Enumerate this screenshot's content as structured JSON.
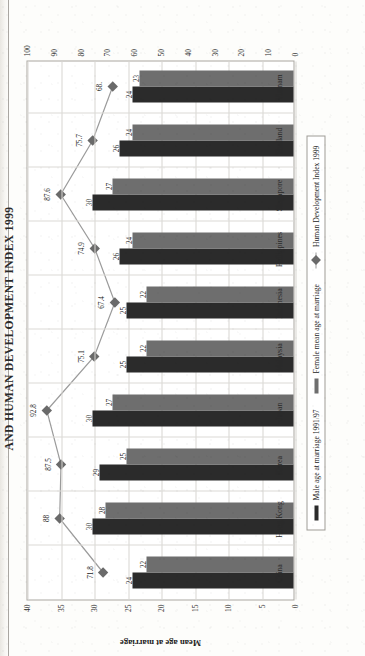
{
  "page": {
    "title": "AND HUMAN DEVELOPMENT INDEX 1999"
  },
  "axes": {
    "left_title": "Mean age at marriage",
    "left_ticks": [
      "40",
      "35",
      "30",
      "25",
      "20",
      "15",
      "10",
      "5",
      "0"
    ],
    "right_ticks": [
      "100",
      "90",
      "80",
      "70",
      "60",
      "50",
      "40",
      "30",
      "20",
      "10",
      "0"
    ]
  },
  "legend": {
    "items": [
      {
        "label": "Male age at marriage 1991/97",
        "marker": "bar-swatch-dark",
        "color": "#2b2b2b"
      },
      {
        "label": "Female mean age at marriage",
        "marker": "bar-swatch-grey",
        "color": "#6e6e6e"
      },
      {
        "label": "Human Development Index 1999",
        "marker": "diamond-line-marker",
        "color": "#6a6a6a"
      }
    ]
  },
  "chart_data": {
    "type": "bar",
    "title": "AND HUMAN DEVELOPMENT INDEX 1999",
    "xlabel": "",
    "ylabel": "Mean age at marriage",
    "ylim": [
      0,
      40
    ],
    "y2lim": [
      0,
      100
    ],
    "grid": true,
    "legend_position": "bottom",
    "categories": [
      "China",
      "Hong Kong",
      "Korea",
      "Japan",
      "Malaysia",
      "Indonesia",
      "Philippines",
      "Singapore",
      "Thailand",
      "Vietnam"
    ],
    "series": [
      {
        "name": "Male age at marriage 1991/97",
        "axis": "left",
        "type": "bar",
        "values": [
          24,
          30,
          29,
          30,
          25,
          25,
          26,
          30,
          26,
          24
        ]
      },
      {
        "name": "Female mean age at marriage",
        "axis": "left",
        "type": "bar",
        "values": [
          22,
          28,
          25,
          27,
          22,
          22,
          24,
          27,
          24,
          23
        ]
      },
      {
        "name": "Human Development Index 1999",
        "axis": "right",
        "type": "line",
        "values": [
          71.8,
          88.0,
          87.5,
          92.8,
          75.1,
          67.4,
          74.9,
          87.6,
          75.7,
          68.2
        ],
        "labels": [
          "71.8",
          "88",
          "87.5",
          "92.8",
          "75.1",
          "67.4",
          "74.9",
          "87.6",
          "75.7",
          "68."
        ]
      }
    ]
  },
  "colors": {
    "male_bar": "#2b2b2b",
    "female_bar": "#6e6e6e",
    "hdi_line": "#9b9b9b",
    "hdi_marker": "#6a6a6a",
    "grid": "#d8d6d1",
    "frame": "#a9a6a0",
    "paper": "#fdfdfb"
  }
}
